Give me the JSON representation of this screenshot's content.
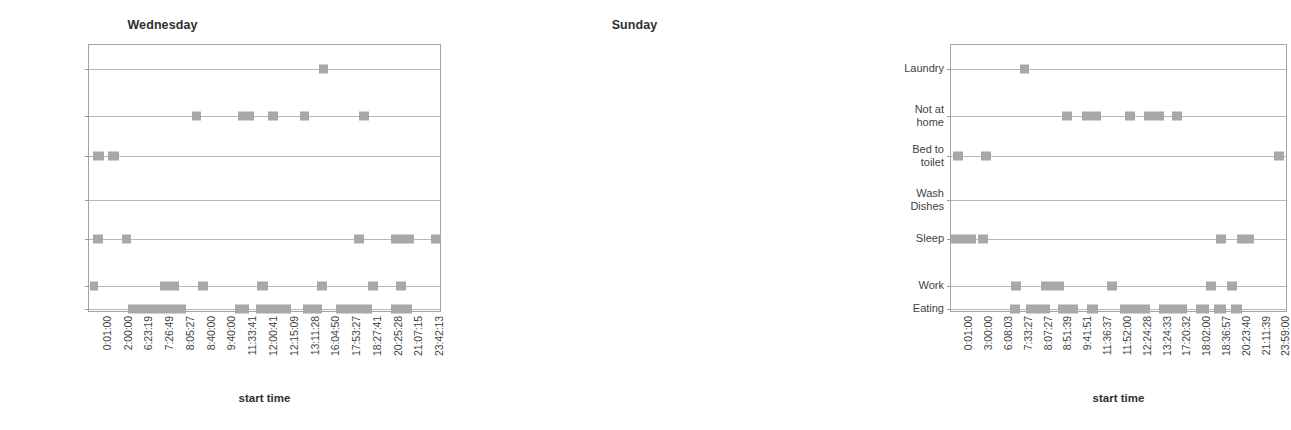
{
  "page": {
    "background": "#ffffff",
    "marker_color": "#a8a8a8",
    "frame_color": "#a3a3a3",
    "gridline_color": "#b7b7b7",
    "text_color": "#3f3f3f"
  },
  "charts": [
    {
      "id": "wednesday",
      "title": "Wednesday",
      "xlabel": "start time",
      "categories": [
        "Laundry",
        "Not at\nhome",
        "Bed to\nToilet",
        "Wash\nDishes",
        "Sleep",
        "Work",
        "Eating"
      ],
      "xticks": [
        "0:01:00",
        "2:00:00",
        "6:23:19",
        "7:26:49",
        "8:05:27",
        "8:40:00",
        "9:40:00",
        "11:33:41",
        "12:00:41",
        "12:15:09",
        "13:11:28",
        "16:04:50",
        "17:53:27",
        "18:27:41",
        "20:25:28",
        "21:07:15",
        "23:42:13"
      ]
    },
    {
      "id": "sunday",
      "title": "Sunday",
      "xlabel": "start time",
      "categories": [
        "Laundry",
        "Not at\nhome",
        "Bed to\ntoilet",
        "Wash\nDishes",
        "Sleep",
        "Work",
        "Eating"
      ],
      "xticks": [
        "0:01:00",
        "3:00:00",
        "6:08:03",
        "7:33:27",
        "8:07:27",
        "8:51:39",
        "9:41:51",
        "11:36:37",
        "11:52:00",
        "12:24:28",
        "13:24:33",
        "17:20:32",
        "18:02:00",
        "18:36:57",
        "20:23:40",
        "21:11:39",
        "23:59:00"
      ]
    }
  ],
  "chart_data": [
    {
      "type": "scatter",
      "title": "Wednesday",
      "xlabel": "start time",
      "ylabel": "",
      "grid": true,
      "legend": false,
      "categories": [
        "Laundry",
        "Not at home",
        "Bed to Toilet",
        "Wash Dishes",
        "Sleep",
        "Work",
        "Eating"
      ],
      "xtick_labels": [
        "0:01:00",
        "2:00:00",
        "6:23:19",
        "7:26:49",
        "8:05:27",
        "8:40:00",
        "9:40:00",
        "11:33:41",
        "12:00:41",
        "12:15:09",
        "13:11:28",
        "16:04:50",
        "17:53:27",
        "18:27:41",
        "20:25:28",
        "21:07:15",
        "23:42:13"
      ],
      "xlim": [
        0,
        100
      ],
      "note": "x positions are percentages across the plot width; width is the drawn extent of each marker cluster in percent",
      "series": [
        {
          "name": "Laundry",
          "points": [
            {
              "x": 65.5,
              "w": 2.6
            }
          ]
        },
        {
          "name": "Not at home",
          "points": [
            {
              "x": 29.3,
              "w": 2.6
            },
            {
              "x": 42.5,
              "w": 4.5
            },
            {
              "x": 51.0,
              "w": 2.8
            },
            {
              "x": 60.0,
              "w": 2.8
            },
            {
              "x": 77.0,
              "w": 2.8
            }
          ]
        },
        {
          "name": "Bed to Toilet",
          "points": [
            {
              "x": 1.2,
              "w": 3.1
            },
            {
              "x": 5.4,
              "w": 3.1
            }
          ]
        },
        {
          "name": "Wash Dishes",
          "points": []
        },
        {
          "name": "Sleep",
          "points": [
            {
              "x": 1.2,
              "w": 2.8
            },
            {
              "x": 9.3,
              "w": 2.8
            },
            {
              "x": 75.6,
              "w": 2.8
            },
            {
              "x": 86.0,
              "w": 6.5
            },
            {
              "x": 97.5,
              "w": 2.8
            }
          ]
        },
        {
          "name": "Work",
          "points": [
            {
              "x": 0.2,
              "w": 2.5
            },
            {
              "x": 20.3,
              "w": 5.2
            },
            {
              "x": 31.0,
              "w": 2.8
            },
            {
              "x": 48.0,
              "w": 3.0
            },
            {
              "x": 65.0,
              "w": 2.8
            },
            {
              "x": 79.5,
              "w": 2.8
            },
            {
              "x": 87.5,
              "w": 2.8
            }
          ]
        },
        {
          "name": "Eating",
          "points": [
            {
              "x": 11.0,
              "w": 16.5
            },
            {
              "x": 41.5,
              "w": 4.0
            },
            {
              "x": 47.5,
              "w": 10.0
            },
            {
              "x": 61.0,
              "w": 5.5
            },
            {
              "x": 70.5,
              "w": 10.0
            },
            {
              "x": 86.0,
              "w": 6.0
            }
          ]
        }
      ]
    },
    {
      "type": "scatter",
      "title": "Sunday",
      "xlabel": "start time",
      "ylabel": "",
      "grid": true,
      "legend": false,
      "categories": [
        "Laundry",
        "Not at home",
        "Bed to toilet",
        "Wash Dishes",
        "Sleep",
        "Work",
        "Eating"
      ],
      "xtick_labels": [
        "0:01:00",
        "3:00:00",
        "6:08:03",
        "7:33:27",
        "8:07:27",
        "8:51:39",
        "9:41:51",
        "11:36:37",
        "11:52:00",
        "12:24:28",
        "13:24:33",
        "17:20:32",
        "18:02:00",
        "18:36:57",
        "20:23:40",
        "21:11:39",
        "23:59:00"
      ],
      "xlim": [
        0,
        100
      ],
      "note": "x positions are percentages across the plot width; width is the drawn extent of each marker cluster in percent",
      "series": [
        {
          "name": "Laundry",
          "points": [
            {
              "x": 20.5,
              "w": 2.9
            }
          ]
        },
        {
          "name": "Not at home",
          "points": [
            {
              "x": 33.0,
              "w": 3.0
            },
            {
              "x": 39.0,
              "w": 5.8
            },
            {
              "x": 52.0,
              "w": 3.0
            },
            {
              "x": 57.5,
              "w": 6.2
            },
            {
              "x": 66.0,
              "w": 3.0
            }
          ]
        },
        {
          "name": "Bed to toilet",
          "points": [
            {
              "x": 0.5,
              "w": 3.0
            },
            {
              "x": 9.0,
              "w": 3.0
            },
            {
              "x": 96.5,
              "w": 3.0
            }
          ]
        },
        {
          "name": "Wash Dishes",
          "points": []
        },
        {
          "name": "Sleep",
          "points": [
            {
              "x": 0.0,
              "w": 7.5
            },
            {
              "x": 8.0,
              "w": 3.0
            },
            {
              "x": 79.0,
              "w": 3.0
            },
            {
              "x": 85.5,
              "w": 5.0
            }
          ]
        },
        {
          "name": "Work",
          "points": [
            {
              "x": 18.0,
              "w": 3.0
            },
            {
              "x": 27.0,
              "w": 6.8
            },
            {
              "x": 46.5,
              "w": 3.0
            },
            {
              "x": 76.0,
              "w": 3.0
            },
            {
              "x": 82.5,
              "w": 3.0
            }
          ]
        },
        {
          "name": "Eating",
          "points": [
            {
              "x": 17.5,
              "w": 3.2
            },
            {
              "x": 22.5,
              "w": 7.0
            },
            {
              "x": 32.0,
              "w": 6.0
            },
            {
              "x": 40.5,
              "w": 3.4
            },
            {
              "x": 50.5,
              "w": 9.0
            },
            {
              "x": 62.0,
              "w": 8.5
            },
            {
              "x": 73.0,
              "w": 4.0
            },
            {
              "x": 78.5,
              "w": 3.6
            },
            {
              "x": 83.5,
              "w": 3.4
            }
          ]
        }
      ]
    }
  ]
}
